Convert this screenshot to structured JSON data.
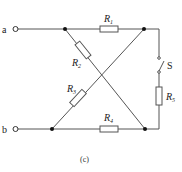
{
  "diagram": {
    "type": "circuit",
    "caption": "(c)",
    "terminals": [
      {
        "id": "a",
        "label": "a"
      },
      {
        "id": "b",
        "label": "b"
      }
    ],
    "components": [
      {
        "id": "R1",
        "kind": "resistor",
        "label": "R",
        "sub": "1"
      },
      {
        "id": "R2",
        "kind": "resistor",
        "label": "R",
        "sub": "2"
      },
      {
        "id": "R3",
        "kind": "resistor",
        "label": "R",
        "sub": "3"
      },
      {
        "id": "R4",
        "kind": "resistor",
        "label": "R",
        "sub": "4"
      },
      {
        "id": "R5",
        "kind": "resistor",
        "label": "R",
        "sub": "5"
      },
      {
        "id": "S",
        "kind": "switch",
        "label": "S"
      }
    ],
    "colors": {
      "wire": "#555555",
      "node": "#111111",
      "background": "#ffffff"
    }
  }
}
